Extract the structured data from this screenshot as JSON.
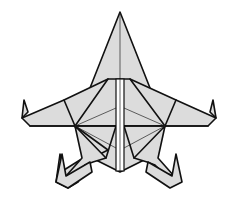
{
  "diagram": {
    "colors": {
      "paper": "#dcdcdc",
      "line": "#111111",
      "background": "#ffffff"
    },
    "parts": [
      "nose",
      "left-wing",
      "right-wing",
      "center-strip",
      "left-leg",
      "right-leg",
      "tail"
    ]
  }
}
